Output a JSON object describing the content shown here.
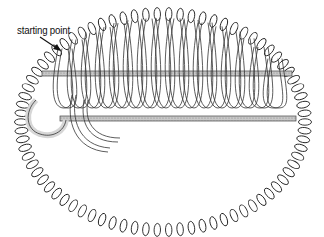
{
  "figure": {
    "annotation": {
      "label": "starting point",
      "arrow": "arrow-pointing-down-right"
    },
    "colors": {
      "background": "#ffffff",
      "ink": "#222222",
      "rod_fill": "#bdbdbd",
      "loop_fill": "#e2e2e2"
    }
  }
}
